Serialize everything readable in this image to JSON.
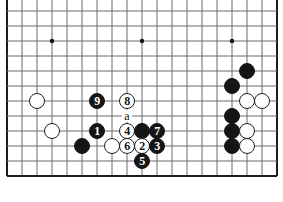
{
  "diagram": {
    "kind": "go-board-diagram",
    "board": {
      "origin_x": 7,
      "origin_y": 11,
      "spacing": 15,
      "cols": 19,
      "rows": 12,
      "line_color": "#6b6b6b",
      "edge_color": "#1c1c1c",
      "background": "#ffffff",
      "star_point_color": "#151515",
      "star_points": [
        {
          "col": 3,
          "row": 2
        },
        {
          "col": 9,
          "row": 2
        },
        {
          "col": 15,
          "row": 2
        }
      ],
      "edges": {
        "left": true,
        "right": true,
        "bottom": true,
        "top": false
      }
    },
    "colors": {
      "black_stone": "#151515",
      "white_stone": "#ffffff",
      "white_stone_border": "#202020",
      "black_number_text": "#ffffff",
      "white_number_text": "#151515",
      "label_text": "#101010"
    },
    "stones": [
      {
        "id": "w-a1",
        "color": "white",
        "col": 2,
        "row": 6,
        "label": ""
      },
      {
        "id": "w-a2",
        "color": "white",
        "col": 3,
        "row": 8,
        "label": ""
      },
      {
        "id": "b-a1",
        "color": "black",
        "col": 5,
        "row": 9,
        "label": ""
      },
      {
        "id": "move-9",
        "color": "black",
        "col": 6,
        "row": 6,
        "label": "9"
      },
      {
        "id": "move-1",
        "color": "black",
        "col": 6,
        "row": 8,
        "label": "1"
      },
      {
        "id": "move-8",
        "color": "white",
        "col": 8,
        "row": 6,
        "label": "8"
      },
      {
        "id": "move-4",
        "color": "white",
        "col": 8,
        "row": 8,
        "label": "4"
      },
      {
        "id": "w-a3",
        "color": "white",
        "col": 7,
        "row": 9,
        "label": ""
      },
      {
        "id": "move-6",
        "color": "white",
        "col": 8,
        "row": 9,
        "label": "6"
      },
      {
        "id": "b-a2",
        "color": "black",
        "col": 9,
        "row": 8,
        "label": ""
      },
      {
        "id": "move-2",
        "color": "white",
        "col": 9,
        "row": 9,
        "label": "2"
      },
      {
        "id": "move-7",
        "color": "black",
        "col": 10,
        "row": 8,
        "label": "7"
      },
      {
        "id": "move-3",
        "color": "black",
        "col": 10,
        "row": 9,
        "label": "3"
      },
      {
        "id": "move-5",
        "color": "black",
        "col": 9,
        "row": 10,
        "label": "5"
      },
      {
        "id": "b-r1",
        "color": "black",
        "col": 16,
        "row": 4,
        "label": ""
      },
      {
        "id": "b-r2",
        "color": "black",
        "col": 15,
        "row": 5,
        "label": ""
      },
      {
        "id": "w-r1",
        "color": "white",
        "col": 16,
        "row": 6,
        "label": ""
      },
      {
        "id": "w-r2",
        "color": "white",
        "col": 17,
        "row": 6,
        "label": ""
      },
      {
        "id": "b-r3",
        "color": "black",
        "col": 15,
        "row": 7,
        "label": ""
      },
      {
        "id": "b-r4",
        "color": "black",
        "col": 15,
        "row": 8,
        "label": ""
      },
      {
        "id": "w-r3",
        "color": "white",
        "col": 16,
        "row": 8,
        "label": ""
      },
      {
        "id": "b-r5",
        "color": "black",
        "col": 15,
        "row": 9,
        "label": ""
      },
      {
        "id": "w-r4",
        "color": "white",
        "col": 16,
        "row": 9,
        "label": ""
      }
    ],
    "point_labels": [
      {
        "id": "label-a",
        "text": "a",
        "col": 8,
        "row": 7
      }
    ]
  }
}
